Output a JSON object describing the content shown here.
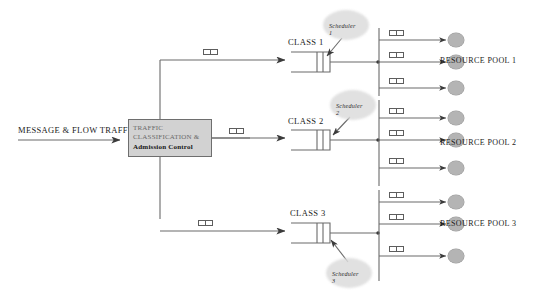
{
  "diagram": {
    "input": {
      "label": "MESSAGE & FLOW TRAFFIC"
    },
    "classifier": {
      "line1": "TRAFFIC",
      "line2": "CLASSIFICATION &",
      "line3": "Admission Control"
    },
    "classes": [
      {
        "label": "CLASS 1",
        "scheduler": "Scheduler 1"
      },
      {
        "label": "CLASS 2",
        "scheduler": "Scheduler 2"
      },
      {
        "label": "CLASS 3",
        "scheduler": "Scheduler 3"
      }
    ],
    "pools": [
      {
        "label": "RESOURCE POOL 1"
      },
      {
        "label": "RESOURCE POOL 2"
      },
      {
        "label": "RESOURCE POOL 3"
      }
    ],
    "colors": {
      "line": "#5d5d5d",
      "classifier_fill": "#d2d2d2",
      "resource_fill": "#b4b4b4",
      "scheduler_fill": "#dcdcdc",
      "text": "#1b1b1b"
    },
    "counts": {
      "class_branch_packets": 3,
      "pool_branch_packets": 9,
      "resource_nodes": 9
    }
  }
}
